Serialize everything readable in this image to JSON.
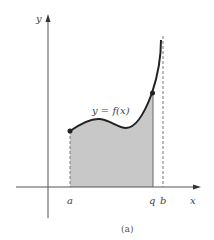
{
  "figure": {
    "caption": "(a)",
    "curve_label": "y = f(x)",
    "axes": {
      "x_label": "x",
      "y_label": "y"
    },
    "x_ticks": {
      "a": "a",
      "q": "q",
      "b": "b"
    },
    "colors": {
      "curve": "#222222",
      "axis": "#555555",
      "shade": "#c8c8c8",
      "dashed": "#777777"
    }
  }
}
